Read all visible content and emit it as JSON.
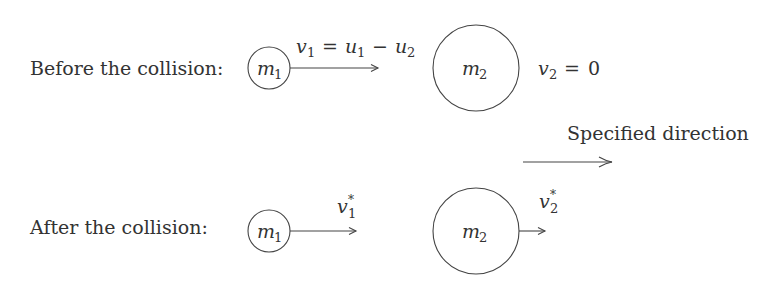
{
  "diagram": {
    "before": {
      "label": "Before the collision:",
      "m1": {
        "name": "m",
        "sub": "1"
      },
      "m2": {
        "name": "m",
        "sub": "2"
      },
      "v1_label": {
        "v": "v",
        "vsub": "1",
        "eq": "=",
        "u1": "u",
        "u1sub": "1",
        "minus": "−",
        "u2": "u",
        "u2sub": "2"
      },
      "v2_label": {
        "v": "v",
        "vsub": "2",
        "eq": "=",
        "val": "0"
      }
    },
    "direction": {
      "label": "Specified direction"
    },
    "after": {
      "label": "After the collision:",
      "m1": {
        "name": "m",
        "sub": "1"
      },
      "m2": {
        "name": "m",
        "sub": "2"
      },
      "v1_label": {
        "v": "v",
        "sub": "1",
        "sup": "*"
      },
      "v2_label": {
        "v": "v",
        "sub": "2",
        "sup": "*"
      }
    },
    "colors": {
      "stroke": "#444444",
      "text": "#333333",
      "background": "#ffffff"
    }
  }
}
